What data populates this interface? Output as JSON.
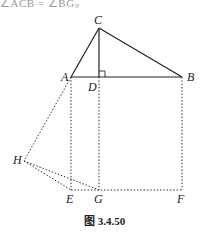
{
  "top_text": "∠ACB = ∠BG。",
  "figure": {
    "caption": "图 3.4.50",
    "points": {
      "C": {
        "label": "C",
        "x": 99,
        "y": 28
      },
      "A": {
        "label": "A",
        "x": 71,
        "y": 77
      },
      "D": {
        "label": "D",
        "x": 99,
        "y": 77
      },
      "B": {
        "label": "B",
        "x": 182,
        "y": 77
      },
      "H": {
        "label": "H",
        "x": 24,
        "y": 161
      },
      "E": {
        "label": "E",
        "x": 71,
        "y": 190
      },
      "G": {
        "label": "G",
        "x": 99,
        "y": 190
      },
      "F": {
        "label": "F",
        "x": 182,
        "y": 190
      }
    },
    "solid_segments": [
      "CA",
      "CB",
      "CD",
      "AB"
    ],
    "dashed_segments": [
      "AE",
      "DG",
      "BF",
      "EF",
      "AH",
      "HE",
      "HG"
    ],
    "right_angle_at": "D",
    "line_color": "#222222"
  }
}
